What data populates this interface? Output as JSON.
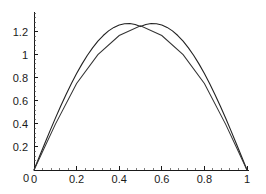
{
  "chart_data": {
    "type": "line",
    "title": "",
    "subtitle": "",
    "xlabel": "",
    "ylabel": "",
    "xlim": [
      0,
      1.02
    ],
    "ylim": [
      0,
      1.34
    ],
    "grid": false,
    "legend": "none",
    "background_color": "#ffffff",
    "line_color": "#222222",
    "axis_color": "#1a1a1a",
    "x_ticks": [
      0,
      0.2,
      0.4,
      0.6,
      0.8,
      1
    ],
    "x_tick_labels": [
      "0",
      "0.2",
      "0.4",
      "0.6",
      "0.8",
      "1"
    ],
    "y_ticks": [
      0,
      0.2,
      0.4,
      0.6,
      0.8,
      1,
      1.2
    ],
    "y_tick_labels": [
      "0",
      "0.2",
      "0.4",
      "0.6",
      "0.8",
      "1",
      "1.2"
    ],
    "y_tick_labels_shown": [
      "0.2",
      "0.4",
      "0.6",
      "0.8",
      "1",
      "1.2"
    ],
    "x_minor_ticks_per_interval": 4,
    "y_minor_ticks_per_interval": 4,
    "series": [
      {
        "name": "smooth curve",
        "style": "solid",
        "color": "#222222",
        "x": [
          0,
          0.025,
          0.05,
          0.075,
          0.1,
          0.125,
          0.15,
          0.175,
          0.2,
          0.225,
          0.25,
          0.275,
          0.3,
          0.325,
          0.35,
          0.375,
          0.4,
          0.425,
          0.45,
          0.475,
          0.5,
          0.525,
          0.55,
          0.575,
          0.6,
          0.625,
          0.65,
          0.675,
          0.7,
          0.725,
          0.75,
          0.775,
          0.8,
          0.825,
          0.85,
          0.875,
          0.9,
          0.925,
          0.95,
          0.975,
          1
        ],
        "values": [
          0,
          0.0998,
          0.1987,
          0.2959,
          0.3906,
          0.482,
          0.5694,
          0.652,
          0.7293,
          0.8007,
          0.8656,
          0.9235,
          0.9741,
          1.0169,
          1.0517,
          1.0783,
          1.0964,
          1.1061,
          1.1072,
          1.0999,
          1.0843,
          1.0999,
          1.1072,
          1.1061,
          1.0964,
          1.0783,
          1.0517,
          1.0169,
          0.9741,
          0.9235,
          0.8656,
          0.8007,
          0.7293,
          0.652,
          0.5694,
          0.482,
          0.3906,
          0.2959,
          0.1987,
          0.0998,
          0
        ]
      },
      {
        "name": "piecewise linear approximation",
        "style": "solid",
        "color": "#333333",
        "x": [
          0,
          0.1,
          0.2,
          0.3,
          0.4,
          0.5,
          0.6,
          0.7,
          0.8,
          0.9,
          1
        ],
        "values": [
          0,
          0.38,
          0.72,
          0.96,
          1.12,
          1.2,
          1.12,
          0.96,
          0.72,
          0.38,
          0
        ]
      }
    ],
    "peak": {
      "x": 0.5,
      "smooth_y": 1.27,
      "piecewise_y": 1.25
    }
  },
  "axes": {
    "x_axis_name": "horizontal-axis",
    "y_axis_name": "vertical-axis"
  }
}
